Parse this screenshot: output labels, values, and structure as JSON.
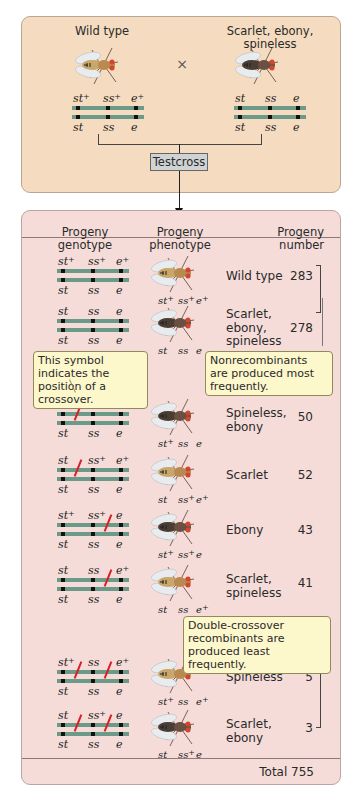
{
  "cross": {
    "parent1": {
      "label": "Wild type",
      "top": [
        "st",
        "ss",
        "e"
      ],
      "top_plus": [
        true,
        true,
        true
      ],
      "bottom": [
        "st",
        "ss",
        "e"
      ]
    },
    "parent2": {
      "label": "Scarlet, ebony, spineless",
      "top": [
        "st",
        "ss",
        "e"
      ],
      "top_plus": [
        false,
        false,
        false
      ],
      "bottom": [
        "st",
        "ss",
        "e"
      ]
    },
    "symbol": "×",
    "testcross_label": "Testcross"
  },
  "table": {
    "headers": {
      "genotype": "Progeny genotype",
      "phenotype": "Progeny phenotype",
      "number": "Progeny number"
    },
    "rows": [
      {
        "phenotype": "Wild type",
        "number": "283",
        "top": [
          "st",
          "ss",
          "e"
        ],
        "plus": [
          true,
          true,
          true
        ],
        "crossovers": [],
        "fly_labels": [
          "st",
          "ss",
          "e"
        ],
        "fly_plus": [
          true,
          true,
          true
        ],
        "fly": "wild"
      },
      {
        "phenotype": "Scarlet, ebony, spineless",
        "number": "278",
        "top": [
          "st",
          "ss",
          "e"
        ],
        "plus": [
          false,
          false,
          false
        ],
        "crossovers": [],
        "fly_labels": [
          "st",
          "ss",
          "e"
        ],
        "fly_plus": [
          false,
          false,
          false
        ],
        "fly": "dark"
      },
      {
        "phenotype": "Spineless, ebony",
        "number": "50",
        "top": [
          "st",
          "ss",
          "e"
        ],
        "plus": [
          true,
          false,
          false
        ],
        "crossovers": [
          1
        ],
        "fly_labels": [
          "st",
          "ss",
          "e"
        ],
        "fly_plus": [
          true,
          false,
          false
        ],
        "fly": "dark"
      },
      {
        "phenotype": "Scarlet",
        "number": "52",
        "top": [
          "st",
          "ss",
          "e"
        ],
        "plus": [
          false,
          true,
          true
        ],
        "crossovers": [
          1
        ],
        "fly_labels": [
          "st",
          "ss",
          "e"
        ],
        "fly_plus": [
          false,
          true,
          true
        ],
        "fly": "wild"
      },
      {
        "phenotype": "Ebony",
        "number": "43",
        "top": [
          "st",
          "ss",
          "e"
        ],
        "plus": [
          true,
          true,
          false
        ],
        "crossovers": [
          2
        ],
        "fly_labels": [
          "st",
          "ss",
          "e"
        ],
        "fly_plus": [
          true,
          true,
          false
        ],
        "fly": "dark"
      },
      {
        "phenotype": "Scarlet, spineless",
        "number": "41",
        "top": [
          "st",
          "ss",
          "e"
        ],
        "plus": [
          false,
          false,
          true
        ],
        "crossovers": [
          2
        ],
        "fly_labels": [
          "st",
          "ss",
          "e"
        ],
        "fly_plus": [
          false,
          false,
          true
        ],
        "fly": "wild"
      },
      {
        "phenotype": "Spineless",
        "number": "5",
        "top": [
          "st",
          "ss",
          "e"
        ],
        "plus": [
          true,
          false,
          true
        ],
        "crossovers": [
          1,
          2
        ],
        "fly_labels": [
          "st",
          "ss",
          "e"
        ],
        "fly_plus": [
          true,
          false,
          true
        ],
        "fly": "wild"
      },
      {
        "phenotype": "Scarlet, ebony",
        "number": "3",
        "top": [
          "st",
          "ss",
          "e"
        ],
        "plus": [
          false,
          true,
          false
        ],
        "crossovers": [
          1,
          2
        ],
        "fly_labels": [
          "st",
          "ss",
          "e"
        ],
        "fly_plus": [
          false,
          true,
          false
        ],
        "fly": "dark"
      }
    ],
    "total_label": "Total 755"
  },
  "callouts": {
    "crossover_symbol": "This symbol indicates the position of a crossover.",
    "nonrecombinants": "Nonrecombinants are produced most frequently.",
    "double_crossover": "Double-crossover recombinants are produced least frequently."
  },
  "colors": {
    "top_panel": "#f5dcc0",
    "bottom_panel": "#f5dcd9",
    "chromosome": "#6b9a88",
    "crossover": "#d81f26",
    "callout": "#fdf7cc"
  }
}
